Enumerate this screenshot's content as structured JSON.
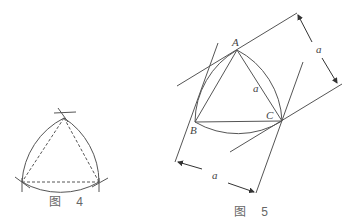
{
  "figure4": {
    "caption": "图 4",
    "vertices": [
      [
        64,
        118
      ],
      [
        22,
        182
      ],
      [
        99,
        182
      ]
    ],
    "description": "Reuleaux triangle constructed on equilateral triangle (dashed)"
  },
  "figure5": {
    "caption": "图 5",
    "vertices": {
      "A": [
        237,
        50
      ],
      "B": [
        195,
        122
      ],
      "C": [
        282,
        121
      ]
    },
    "labels": {
      "A": "A",
      "B": "B",
      "C": "C",
      "side": "a",
      "width_top": "a",
      "width_bottom": "a"
    },
    "description": "Reuleaux triangle between parallel supporting lines at distance a"
  },
  "colors": {
    "line": "#555555",
    "background": "#ffffff"
  }
}
